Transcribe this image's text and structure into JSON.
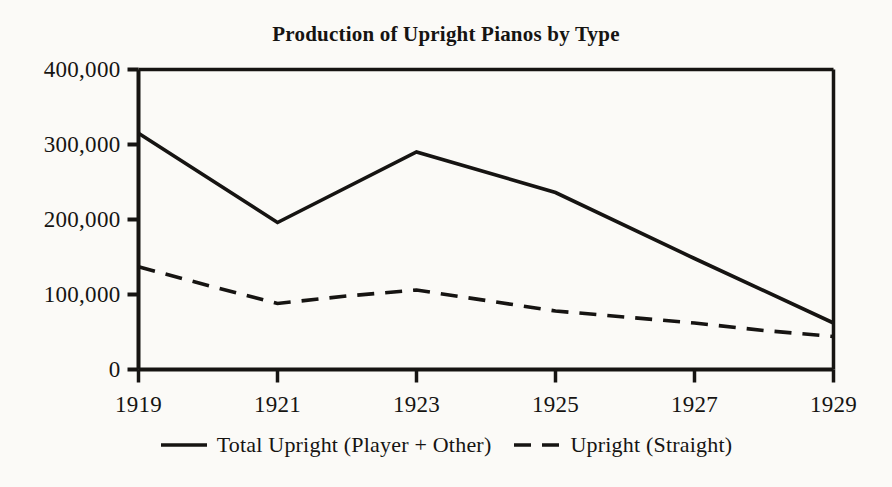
{
  "chart_data": {
    "type": "line",
    "title": "Production of Upright Pianos by Type",
    "xlabel": "",
    "ylabel": "",
    "xlim": [
      1919,
      1929
    ],
    "ylim": [
      0,
      400000
    ],
    "grid": false,
    "legend_position": "bottom",
    "x_tick_labels": [
      "1919",
      "1921",
      "1923",
      "1925",
      "1927",
      "1929"
    ],
    "x_tick_values": [
      1919,
      1921,
      1923,
      1925,
      1927,
      1929
    ],
    "y_tick_labels": [
      "0",
      "100,000",
      "200,000",
      "300,000",
      "400,000"
    ],
    "y_tick_values": [
      0,
      100000,
      200000,
      300000,
      400000
    ],
    "series": [
      {
        "name": "Total Upright (Player + Other)",
        "style": "solid",
        "color": "#161412",
        "x": [
          1919,
          1921,
          1923,
          1925,
          1927,
          1929
        ],
        "values": [
          315000,
          196000,
          290000,
          236000,
          148000,
          62000
        ]
      },
      {
        "name": "Upright (Straight)",
        "style": "dashed",
        "color": "#161412",
        "x": [
          1919,
          1920,
          1921,
          1922,
          1923,
          1924,
          1925,
          1926,
          1927,
          1928,
          1929
        ],
        "values": [
          137000,
          112000,
          88000,
          98000,
          106000,
          92000,
          78000,
          70000,
          62000,
          52000,
          44000
        ]
      }
    ]
  },
  "legend": {
    "entries": [
      {
        "label": "Total Upright (Player + Other)",
        "dash": "solid"
      },
      {
        "label": "Upright (Straight)",
        "dash": "dashed"
      }
    ]
  },
  "colors": {
    "ink": "#161412",
    "paper": "#fbfaf7"
  }
}
